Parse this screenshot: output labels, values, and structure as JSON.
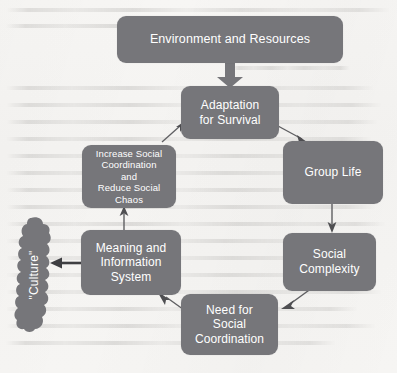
{
  "diagram": {
    "box_color": "#76767a",
    "text_color": "#ffffff",
    "background_color": "#f6f5f3",
    "nodes": {
      "environment": "Environment and Resources",
      "adaptation_line1": "Adaptation",
      "adaptation_line2": "for Survival",
      "group_life": "Group Life",
      "complexity_line1": "Social",
      "complexity_line2": "Complexity",
      "need_line1": "Need for",
      "need_line2": "Social",
      "need_line3": "Coordination",
      "meaning_line1": "Meaning and",
      "meaning_line2": "Information",
      "meaning_line3": "System",
      "increase_line1": "Increase Social",
      "increase_line2": "Coordination and",
      "increase_line3": "Reduce Social",
      "increase_line4": "Chaos",
      "culture": "\"Culture\""
    },
    "edges": [
      {
        "from": "environment",
        "to": "adaptation",
        "style": "thick-down"
      },
      {
        "from": "adaptation",
        "to": "group_life",
        "style": "thin-diagonal-down-right"
      },
      {
        "from": "group_life",
        "to": "complexity",
        "style": "thin-down"
      },
      {
        "from": "complexity",
        "to": "need",
        "style": "thin-diagonal-down-left"
      },
      {
        "from": "need",
        "to": "meaning",
        "style": "thin-diagonal-up-left"
      },
      {
        "from": "meaning",
        "to": "increase",
        "style": "thin-up"
      },
      {
        "from": "increase",
        "to": "adaptation",
        "style": "thin-diagonal-up-right"
      },
      {
        "from": "meaning",
        "to": "culture",
        "style": "thick-left"
      }
    ]
  }
}
